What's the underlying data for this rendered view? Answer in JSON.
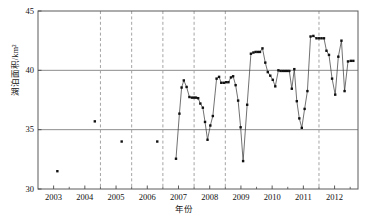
{
  "chart_data": {
    "type": "scatter",
    "title": "",
    "subtitle": "",
    "xlabel": "年份",
    "ylabel": "湖泊面积/km²",
    "xlim": [
      2002.5,
      2012.75
    ],
    "ylim": [
      30,
      45
    ],
    "yticks": [
      30,
      35,
      40,
      45
    ],
    "ytick_labels": [
      "30",
      "35",
      "40",
      "45"
    ],
    "xticks": [
      2003,
      2004,
      2005,
      2006,
      2007,
      2008,
      2009,
      2010,
      2011,
      2012
    ],
    "xtick_labels": [
      "2003",
      "2004",
      "2005",
      "2006",
      "2007",
      "2008",
      "2009",
      "2010",
      "2011",
      "2012"
    ],
    "grid": {
      "horizontal_lines": [
        35,
        40
      ],
      "vertical_dashed_lines": [
        2004.5,
        2005.5,
        2006.5,
        2007.5,
        2008.5,
        2011.5
      ],
      "horizontal_color": "#808080",
      "vertical_color": "#9a9a9a"
    },
    "legend": null,
    "marker": {
      "shape": "square",
      "color": "#111111",
      "size": 2.4
    },
    "line": {
      "color": "#333333",
      "width": 0.7,
      "connects_consecutive_dense_points": true
    },
    "series": [
      {
        "name": "湖泊面积",
        "color": "#111111",
        "points": [
          {
            "x": 2003.12,
            "y": 31.5,
            "connected": false
          },
          {
            "x": 2004.32,
            "y": 35.7,
            "connected": false
          },
          {
            "x": 2005.18,
            "y": 34.0,
            "connected": false
          },
          {
            "x": 2006.32,
            "y": 34.0,
            "connected": false
          },
          {
            "x": 2006.92,
            "y": 32.55,
            "connected": true
          },
          {
            "x": 2007.03,
            "y": 36.35,
            "connected": true
          },
          {
            "x": 2007.1,
            "y": 38.55,
            "connected": true
          },
          {
            "x": 2007.17,
            "y": 39.15,
            "connected": true
          },
          {
            "x": 2007.26,
            "y": 38.6,
            "connected": true
          },
          {
            "x": 2007.35,
            "y": 37.75,
            "connected": true
          },
          {
            "x": 2007.43,
            "y": 37.7,
            "connected": true
          },
          {
            "x": 2007.5,
            "y": 37.7,
            "connected": true
          },
          {
            "x": 2007.56,
            "y": 37.7,
            "connected": true
          },
          {
            "x": 2007.63,
            "y": 37.65,
            "connected": true
          },
          {
            "x": 2007.7,
            "y": 37.2,
            "connected": true
          },
          {
            "x": 2007.78,
            "y": 36.85,
            "connected": true
          },
          {
            "x": 2007.85,
            "y": 35.65,
            "connected": true
          },
          {
            "x": 2007.93,
            "y": 34.15,
            "connected": true
          },
          {
            "x": 2008.02,
            "y": 35.35,
            "connected": true
          },
          {
            "x": 2008.1,
            "y": 36.15,
            "connected": true
          },
          {
            "x": 2008.22,
            "y": 39.3,
            "connected": true
          },
          {
            "x": 2008.3,
            "y": 39.45,
            "connected": true
          },
          {
            "x": 2008.37,
            "y": 38.95,
            "connected": true
          },
          {
            "x": 2008.45,
            "y": 38.95,
            "connected": true
          },
          {
            "x": 2008.53,
            "y": 39.0,
            "connected": true
          },
          {
            "x": 2008.6,
            "y": 39.0,
            "connected": true
          },
          {
            "x": 2008.68,
            "y": 39.4,
            "connected": true
          },
          {
            "x": 2008.75,
            "y": 39.5,
            "connected": true
          },
          {
            "x": 2008.83,
            "y": 38.75,
            "connected": true
          },
          {
            "x": 2008.91,
            "y": 37.45,
            "connected": true
          },
          {
            "x": 2008.99,
            "y": 35.2,
            "connected": true
          },
          {
            "x": 2009.07,
            "y": 32.35,
            "connected": true
          },
          {
            "x": 2009.2,
            "y": 37.1,
            "connected": true
          },
          {
            "x": 2009.32,
            "y": 41.4,
            "connected": true
          },
          {
            "x": 2009.4,
            "y": 41.5,
            "connected": true
          },
          {
            "x": 2009.47,
            "y": 41.55,
            "connected": true
          },
          {
            "x": 2009.54,
            "y": 41.55,
            "connected": true
          },
          {
            "x": 2009.61,
            "y": 41.55,
            "connected": true
          },
          {
            "x": 2009.69,
            "y": 41.85,
            "connected": true
          },
          {
            "x": 2009.78,
            "y": 40.65,
            "connected": true
          },
          {
            "x": 2009.86,
            "y": 39.85,
            "connected": true
          },
          {
            "x": 2009.94,
            "y": 39.55,
            "connected": true
          },
          {
            "x": 2010.02,
            "y": 39.2,
            "connected": true
          },
          {
            "x": 2010.1,
            "y": 38.65,
            "connected": true
          },
          {
            "x": 2010.2,
            "y": 40.0,
            "connected": true
          },
          {
            "x": 2010.27,
            "y": 39.95,
            "connected": true
          },
          {
            "x": 2010.34,
            "y": 39.95,
            "connected": true
          },
          {
            "x": 2010.41,
            "y": 39.95,
            "connected": true
          },
          {
            "x": 2010.48,
            "y": 39.95,
            "connected": true
          },
          {
            "x": 2010.55,
            "y": 39.95,
            "connected": true
          },
          {
            "x": 2010.63,
            "y": 38.45,
            "connected": true
          },
          {
            "x": 2010.71,
            "y": 40.1,
            "connected": true
          },
          {
            "x": 2010.79,
            "y": 37.4,
            "connected": true
          },
          {
            "x": 2010.87,
            "y": 35.95,
            "connected": true
          },
          {
            "x": 2010.95,
            "y": 35.15,
            "connected": true
          },
          {
            "x": 2011.04,
            "y": 36.75,
            "connected": true
          },
          {
            "x": 2011.13,
            "y": 38.25,
            "connected": true
          },
          {
            "x": 2011.23,
            "y": 42.85,
            "connected": true
          },
          {
            "x": 2011.32,
            "y": 42.9,
            "connected": true
          },
          {
            "x": 2011.42,
            "y": 42.7,
            "connected": true
          },
          {
            "x": 2011.5,
            "y": 42.7,
            "connected": true
          },
          {
            "x": 2011.58,
            "y": 42.7,
            "connected": true
          },
          {
            "x": 2011.66,
            "y": 42.7,
            "connected": true
          },
          {
            "x": 2011.74,
            "y": 41.65,
            "connected": true
          },
          {
            "x": 2011.82,
            "y": 41.3,
            "connected": true
          },
          {
            "x": 2011.92,
            "y": 39.3,
            "connected": true
          },
          {
            "x": 2012.02,
            "y": 37.95,
            "connected": true
          },
          {
            "x": 2012.12,
            "y": 41.15,
            "connected": true
          },
          {
            "x": 2012.22,
            "y": 42.5,
            "connected": true
          },
          {
            "x": 2012.32,
            "y": 38.25,
            "connected": true
          },
          {
            "x": 2012.43,
            "y": 40.75,
            "connected": true
          },
          {
            "x": 2012.52,
            "y": 40.8,
            "connected": true
          },
          {
            "x": 2012.6,
            "y": 40.8,
            "connected": true
          }
        ]
      }
    ]
  }
}
